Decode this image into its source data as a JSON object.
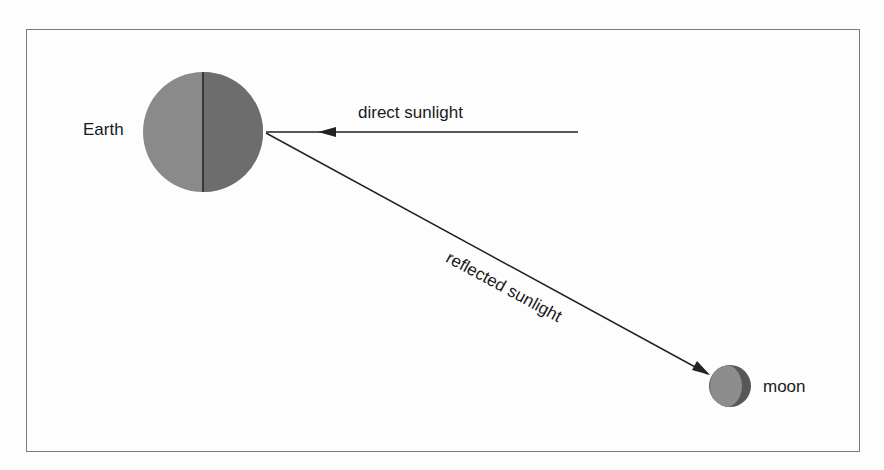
{
  "labels": {
    "earth": "Earth",
    "moon": "moon",
    "direct": "direct sunlight",
    "reflected": "reflected sunlight"
  },
  "colors": {
    "earth_day": "#8a8a8a",
    "earth_night": "#6d6d6d",
    "moon_light": "#8d8d8d",
    "moon_dark": "#575757",
    "line": "#222222",
    "frame": "#7a7a7a"
  }
}
